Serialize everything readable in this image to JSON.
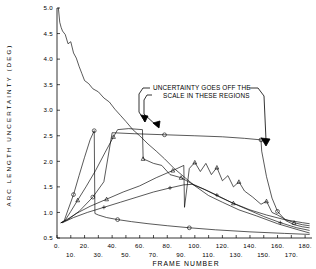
{
  "chart_data": {
    "type": "line",
    "title": "",
    "xlabel": "FRAME NUMBER",
    "ylabel": "ARC LENGTH UNCERTAINTY (DEG)",
    "xlim": [
      0,
      185
    ],
    "ylim": [
      0.5,
      5.0
    ],
    "ytick_step": 0.5,
    "xtick_step": 10,
    "grid": false,
    "legend": "none",
    "yticks": [
      "5.0",
      "4.5",
      "4.0",
      "3.5",
      "3.0",
      "2.5",
      "2.0",
      "1.5",
      "1.0",
      "0.5"
    ],
    "xticks_upper": [
      "0.",
      "20.",
      "40.",
      "60.",
      "80.",
      "100.",
      "120.",
      "140.",
      "160.",
      "180."
    ],
    "xticks_lower": [
      "10.",
      "30.",
      "50.",
      "70.",
      "90.",
      "110.",
      "130.",
      "150.",
      "170."
    ],
    "annotations": [
      {
        "text_line1": "UNCERTAINTY GOES OFF THE",
        "text_line2": "SCALE IN THESE REGIONS",
        "arrow_targets": 3
      }
    ],
    "series": [
      {
        "name": "noisy-decay",
        "marker": "none",
        "note": "Starts at 5.0 near frame 0, noisy monotonic decline through 3.5 near frame 35, crossing 2.5 near frame 62, reaching about 0.95 by frame 140 and flattening near 0.6 by frame 180.",
        "x": [
          1,
          2,
          3,
          4,
          6,
          8,
          10,
          12,
          14,
          16,
          18,
          20,
          23,
          26,
          30,
          34,
          38,
          42,
          46,
          50,
          55,
          60,
          66,
          72,
          78,
          85,
          92,
          100,
          110,
          120,
          132,
          145,
          160,
          175,
          183
        ],
        "y": [
          5.0,
          4.72,
          4.62,
          4.55,
          4.48,
          4.3,
          4.34,
          4.12,
          4.02,
          3.86,
          3.72,
          3.58,
          3.52,
          3.42,
          3.36,
          3.24,
          3.16,
          3.02,
          2.9,
          2.78,
          2.62,
          2.5,
          2.34,
          2.2,
          2.05,
          1.86,
          1.7,
          1.52,
          1.33,
          1.2,
          1.05,
          0.93,
          0.78,
          0.66,
          0.6
        ]
      },
      {
        "name": "spike-early",
        "marker": "circle",
        "note": "Rises from 0.8 at frame 5 very steeply to 2.6 at frame 27, drops vertically back to about 0.95, then decays.",
        "x": [
          3,
          5,
          8,
          12,
          16,
          20,
          24,
          27,
          27.5,
          30,
          36,
          44,
          54,
          66,
          80,
          96,
          115,
          140,
          165,
          183
        ],
        "y": [
          0.8,
          0.82,
          1.05,
          1.35,
          1.72,
          2.08,
          2.42,
          2.6,
          0.98,
          0.95,
          0.9,
          0.86,
          0.82,
          0.78,
          0.74,
          0.7,
          0.66,
          0.62,
          0.59,
          0.57
        ]
      },
      {
        "name": "spike-mid",
        "marker": "triangle",
        "note": "Rises from 0.8 at frame 5 to a flat top near 2.65 between frames 44 and 62, then falls vertically to 2.05 and continues a ragged decline.",
        "x": [
          3,
          6,
          10,
          15,
          21,
          28,
          35,
          41,
          44,
          52,
          62,
          62.5,
          70,
          76,
          82,
          90,
          98,
          108,
          118,
          128,
          140,
          152,
          165,
          178,
          183
        ],
        "y": [
          0.8,
          0.85,
          1.02,
          1.24,
          1.5,
          1.82,
          2.18,
          2.48,
          2.62,
          2.64,
          2.62,
          2.05,
          1.96,
          1.92,
          1.74,
          1.68,
          1.56,
          1.44,
          1.3,
          1.18,
          1.05,
          0.95,
          0.86,
          0.8,
          0.78
        ]
      },
      {
        "name": "plateau-late",
        "marker": "circle",
        "note": "Slow straight rise from 0.8 to a long plateau at 2.55 spanning frames 40 to 148, then falls vertically to 2.2 and decays steeply toward 0.7.",
        "x": [
          3,
          8,
          16,
          26,
          34,
          40,
          56,
          78,
          100,
          120,
          136,
          148,
          148.5,
          152,
          156,
          160,
          166,
          172,
          178,
          183
        ],
        "y": [
          0.8,
          0.86,
          1.02,
          1.3,
          1.6,
          2.56,
          2.54,
          2.52,
          2.5,
          2.48,
          2.45,
          2.42,
          2.2,
          1.7,
          1.28,
          1.02,
          0.84,
          0.76,
          0.72,
          0.7
        ]
      },
      {
        "name": "ragged-peak",
        "marker": "triangle",
        "note": "Broad ragged mountain peaking near 2.0 around frames 98 to 118 with saw-tooth structure, declining on both sides; includes a sharp downward notch near frame 92.",
        "x": [
          6,
          14,
          24,
          36,
          48,
          60,
          72,
          84,
          92,
          92.5,
          96,
          100,
          104,
          108,
          112,
          116,
          120,
          124,
          128,
          132,
          136,
          142,
          148,
          152,
          156,
          160,
          166,
          172,
          178,
          183
        ],
        "y": [
          0.84,
          0.98,
          1.12,
          1.26,
          1.4,
          1.52,
          1.68,
          1.82,
          1.92,
          1.1,
          1.86,
          1.98,
          1.8,
          1.96,
          1.74,
          1.88,
          1.62,
          1.72,
          1.5,
          1.6,
          1.42,
          1.3,
          1.16,
          1.22,
          1.0,
          0.95,
          0.86,
          0.8,
          0.76,
          0.74
        ]
      },
      {
        "name": "low-riser",
        "marker": "plus",
        "note": "Low gradual rise from 0.8 to about 1.55 near frame 98, then steady decline to 0.62.",
        "x": [
          4,
          12,
          22,
          34,
          46,
          58,
          70,
          82,
          92,
          98,
          106,
          116,
          126,
          138,
          150,
          162,
          174,
          183
        ],
        "y": [
          0.8,
          0.9,
          1.0,
          1.1,
          1.2,
          1.3,
          1.4,
          1.48,
          1.54,
          1.55,
          1.46,
          1.34,
          1.2,
          1.06,
          0.92,
          0.8,
          0.7,
          0.65
        ]
      }
    ]
  }
}
